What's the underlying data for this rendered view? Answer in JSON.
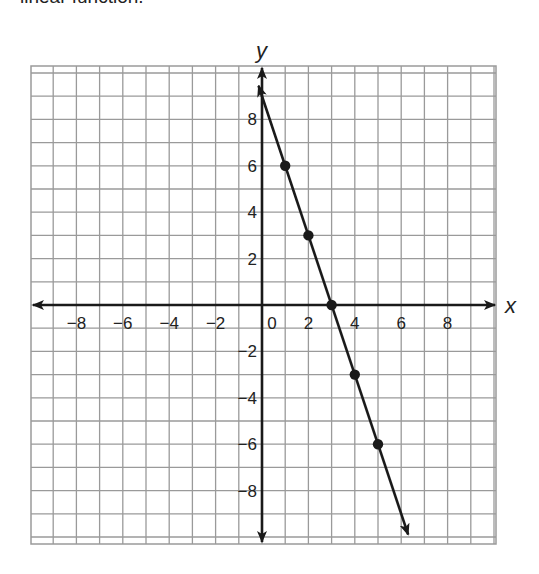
{
  "caption": "linear function.",
  "chart_data": {
    "type": "line",
    "title": "",
    "xlabel": "x",
    "ylabel": "y",
    "xlim": [
      -10,
      10
    ],
    "ylim": [
      -10,
      10
    ],
    "grid": true,
    "grid_step": 1,
    "x_ticks": [
      -8,
      -6,
      -4,
      -2,
      0,
      2,
      4,
      6,
      8
    ],
    "x_tick_labels": [
      "−8",
      "−6",
      "−4",
      "−2",
      "0",
      "2",
      "4",
      "6",
      "8"
    ],
    "y_ticks": [
      8,
      6,
      4,
      2,
      -2,
      -4,
      -6,
      -8
    ],
    "y_tick_labels": [
      "8",
      "6",
      "4",
      "2",
      "−2",
      "−4",
      "−6",
      "−8"
    ],
    "series": [
      {
        "name": "y = -3x + 9",
        "slope": -3,
        "intercept": 9,
        "arrows_both_ends": true,
        "line_extent_x": [
          -0.15,
          6.3
        ],
        "points": [
          {
            "x": 1,
            "y": 6
          },
          {
            "x": 2,
            "y": 3
          },
          {
            "x": 3,
            "y": 0
          },
          {
            "x": 4,
            "y": -3
          },
          {
            "x": 5,
            "y": -6
          }
        ]
      }
    ],
    "colors": {
      "grid": "#9a9a9a",
      "axis": "#1a1a1a",
      "line": "#1a1a1a"
    }
  }
}
